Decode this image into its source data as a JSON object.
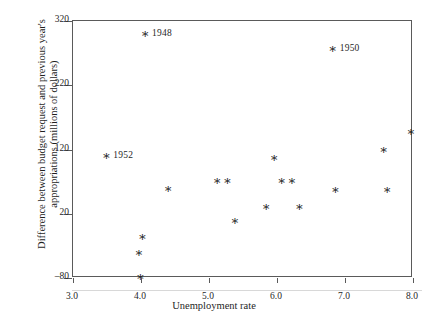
{
  "chart_data": {
    "type": "scatter",
    "title": "",
    "xlabel": "Unemployment rate",
    "ylabel": "Difference between budget request and previous year's appropriations (millions of dollars)",
    "xlim": [
      3.0,
      8.0
    ],
    "ylim": [
      -80,
      320
    ],
    "xticks": [
      "3.0",
      "4.0",
      "5.0",
      "6.0",
      "7.0",
      "8.0"
    ],
    "xtick_values": [
      3.0,
      4.0,
      5.0,
      6.0,
      7.0,
      8.0
    ],
    "yticks": [
      "320",
      "220",
      "120",
      "20",
      "–80"
    ],
    "ytick_values": [
      320,
      220,
      120,
      20,
      -80
    ],
    "grid": false,
    "legend": "none",
    "marker": "asterisk",
    "marker_color": "#1a1a1a",
    "frame_color": "#5a5a5a",
    "points": [
      {
        "x": 4.06,
        "y": 300,
        "label": "1948"
      },
      {
        "x": 6.82,
        "y": 277,
        "label": "1950"
      },
      {
        "x": 3.49,
        "y": 110,
        "label": "1952"
      },
      {
        "x": 7.97,
        "y": 148,
        "label": ""
      },
      {
        "x": 7.57,
        "y": 120,
        "label": ""
      },
      {
        "x": 5.96,
        "y": 107,
        "label": ""
      },
      {
        "x": 6.07,
        "y": 71,
        "label": ""
      },
      {
        "x": 6.22,
        "y": 71,
        "label": ""
      },
      {
        "x": 5.12,
        "y": 71,
        "label": ""
      },
      {
        "x": 5.27,
        "y": 71,
        "label": ""
      },
      {
        "x": 4.4,
        "y": 60,
        "label": ""
      },
      {
        "x": 6.86,
        "y": 58,
        "label": ""
      },
      {
        "x": 7.62,
        "y": 58,
        "label": ""
      },
      {
        "x": 5.84,
        "y": 31,
        "label": ""
      },
      {
        "x": 6.33,
        "y": 31,
        "label": ""
      },
      {
        "x": 5.38,
        "y": 9,
        "label": ""
      },
      {
        "x": 4.02,
        "y": -15,
        "label": ""
      },
      {
        "x": 3.97,
        "y": -41,
        "label": ""
      },
      {
        "x": 3.99,
        "y": -78,
        "label": ""
      }
    ]
  },
  "labels": {
    "p1948": "1948",
    "p1950": "1950",
    "p1952": "1952"
  }
}
